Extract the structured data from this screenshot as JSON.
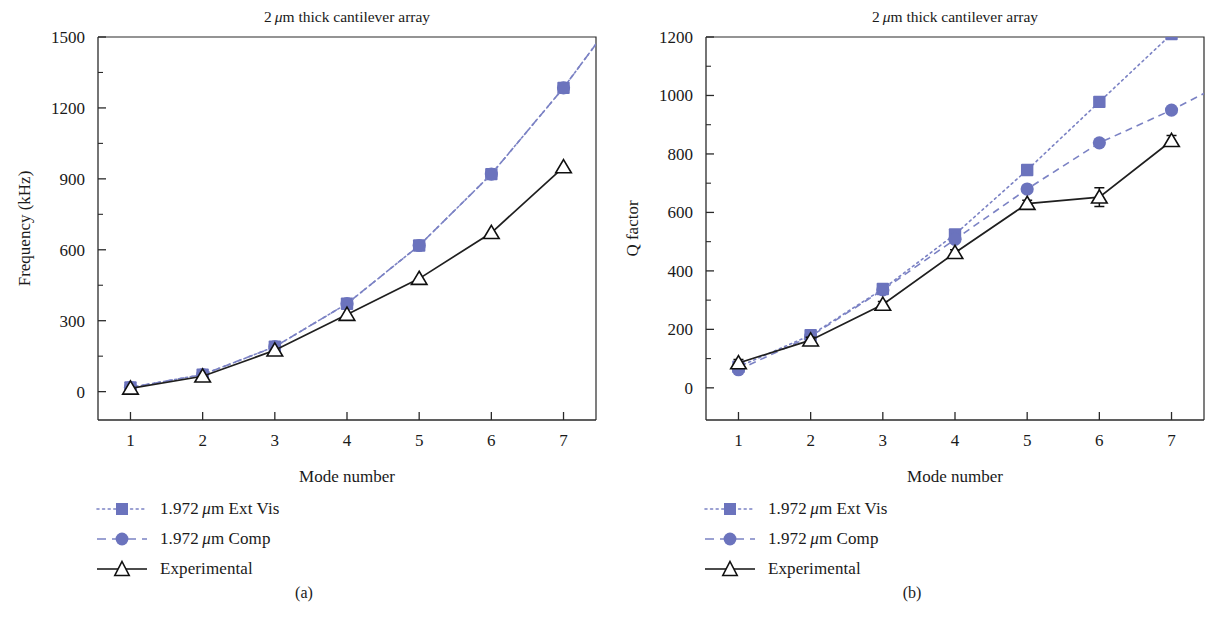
{
  "figure": {
    "panels": [
      {
        "caption": "(a)",
        "title": "2 μm thick cantilever array",
        "title_prefix": "2",
        "title_mu": "μ",
        "title_suffix": "m thick cantilever array",
        "xlabel": "Mode number",
        "ylabel": "Frequency (kHz)",
        "yticks": [
          "0",
          "300",
          "600",
          "900",
          "1200",
          "1500"
        ],
        "xticks": [
          "1",
          "2",
          "3",
          "4",
          "5",
          "6",
          "7"
        ],
        "legend": [
          {
            "label": "1.972 μm Ext Vis",
            "num": "1.972",
            "mu": "μ",
            "rest": "m Ext Vis",
            "key": "dotted-square-key",
            "color": "#6b73bd"
          },
          {
            "label": "1.972 μm Comp",
            "num": "1.972",
            "mu": "μ",
            "rest": "m Comp",
            "key": "dashed-circle-key",
            "color": "#6b73bd"
          },
          {
            "label": "Experimental",
            "num": "",
            "mu": "",
            "rest": "Experimental",
            "key": "solid-triangle-key",
            "color": "#101010"
          }
        ]
      },
      {
        "caption": "(b)",
        "title": "2 μm thick cantilever array",
        "title_prefix": "2",
        "title_mu": "μ",
        "title_suffix": "m thick cantilever array",
        "xlabel": "Mode number",
        "ylabel": "Q factor",
        "yticks": [
          "0",
          "200",
          "400",
          "600",
          "800",
          "1000",
          "1200"
        ],
        "xticks": [
          "1",
          "2",
          "3",
          "4",
          "5",
          "6",
          "7"
        ],
        "legend": [
          {
            "label": "1.972 μm Ext Vis",
            "num": "1.972",
            "mu": "μ",
            "rest": "m Ext Vis",
            "key": "dotted-square-key",
            "color": "#6b73bd"
          },
          {
            "label": "1.972 μm Comp",
            "num": "1.972",
            "mu": "μ",
            "rest": "m Comp",
            "key": "dashed-circle-key",
            "color": "#6b73bd"
          },
          {
            "label": "Experimental",
            "num": "",
            "mu": "",
            "rest": "Experimental",
            "key": "solid-triangle-key",
            "color": "#101010"
          }
        ]
      }
    ]
  },
  "chart_data": [
    {
      "type": "line",
      "panel": "(a)",
      "title": "2 μm thick cantilever array",
      "xlabel": "Mode number",
      "ylabel": "Frequency (kHz)",
      "x": [
        1,
        2,
        3,
        4,
        5,
        6,
        7
      ],
      "xlim": [
        0.55,
        7.45
      ],
      "ylim": [
        -120,
        1500
      ],
      "yticks": [
        0,
        300,
        600,
        900,
        1200,
        1500
      ],
      "yticks_minor": [
        150,
        450,
        750,
        1050,
        1350
      ],
      "xticks": [
        1,
        2,
        3,
        4,
        5,
        6,
        7
      ],
      "grid": false,
      "legend_position": "below-left",
      "series": [
        {
          "name": "1.972 μm Ext Vis",
          "marker": "square",
          "linestyle": "dotted",
          "color": "#6b73bd",
          "values": [
            18,
            72,
            190,
            372,
            618,
            920,
            1285
          ]
        },
        {
          "name": "1.972 μm Comp",
          "marker": "circle",
          "linestyle": "dashed",
          "color": "#6b73bd",
          "values": [
            18,
            72,
            190,
            372,
            618,
            920,
            1285
          ]
        },
        {
          "name": "Experimental",
          "marker": "triangle",
          "linestyle": "solid",
          "color": "#101010",
          "values": [
            14,
            65,
            175,
            326,
            478,
            672,
            950
          ]
        }
      ]
    },
    {
      "type": "line",
      "panel": "(b)",
      "title": "2 μm thick cantilever array",
      "xlabel": "Mode number",
      "ylabel": "Q factor",
      "x": [
        1,
        2,
        3,
        4,
        5,
        6,
        7
      ],
      "xlim": [
        0.55,
        7.45
      ],
      "ylim": [
        -110,
        1200
      ],
      "yticks": [
        0,
        200,
        400,
        600,
        800,
        1000,
        1200
      ],
      "yticks_minor": [
        100,
        300,
        500,
        700,
        900,
        1100
      ],
      "xticks": [
        1,
        2,
        3,
        4,
        5,
        6,
        7
      ],
      "grid": false,
      "legend_position": "below-left",
      "series": [
        {
          "name": "1.972 μm Ext Vis",
          "marker": "square",
          "linestyle": "dotted",
          "color": "#6b73bd",
          "values": [
            72,
            180,
            338,
            525,
            745,
            978,
            1210
          ]
        },
        {
          "name": "1.972 μm Comp",
          "marker": "circle",
          "linestyle": "dashed",
          "color": "#6b73bd",
          "values": [
            62,
            176,
            335,
            508,
            680,
            838,
            950
          ]
        },
        {
          "name": "Experimental",
          "marker": "triangle",
          "linestyle": "solid",
          "color": "#101010",
          "values": [
            85,
            163,
            285,
            462,
            630,
            652,
            845
          ],
          "yerr": [
            12,
            10,
            10,
            10,
            12,
            32,
            18
          ]
        }
      ]
    }
  ]
}
